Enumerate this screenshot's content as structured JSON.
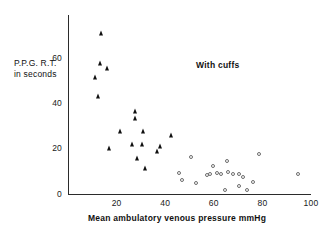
{
  "chart_data": {
    "type": "scatter",
    "title": "",
    "annotation": "With cuffs",
    "xlabel": "Mean  ambulatory  venous  pressure    mmHg",
    "ylabel_line1": "P.P.G.  R.T.",
    "ylabel_line2": "in seconds",
    "xlim": [
      0,
      100
    ],
    "ylim": [
      0,
      77
    ],
    "xticks": [
      20,
      40,
      60,
      80,
      100
    ],
    "yticks": [
      0,
      20,
      40,
      60
    ],
    "xtick_labels": [
      "20",
      "40",
      "60",
      "80",
      "100"
    ],
    "ytick_labels": [
      "0",
      "20",
      "40",
      "60"
    ],
    "grid": false,
    "legend_position": "none",
    "series": [
      {
        "name": "filled-triangle-group",
        "marker": "filled-triangle",
        "color": "#101010",
        "points": [
          {
            "x": 13.6,
            "y": 71.0
          },
          {
            "x": 13.2,
            "y": 57.5
          },
          {
            "x": 11.0,
            "y": 51.5
          },
          {
            "x": 16.0,
            "y": 55.5
          },
          {
            "x": 12.5,
            "y": 43.0
          },
          {
            "x": 17.0,
            "y": 20.0
          },
          {
            "x": 21.5,
            "y": 27.5
          },
          {
            "x": 27.5,
            "y": 36.5
          },
          {
            "x": 27.5,
            "y": 33.5
          },
          {
            "x": 26.5,
            "y": 22.0
          },
          {
            "x": 28.5,
            "y": 15.5
          },
          {
            "x": 30.5,
            "y": 22.0
          },
          {
            "x": 31.0,
            "y": 27.5
          },
          {
            "x": 31.5,
            "y": 11.5
          },
          {
            "x": 36.5,
            "y": 19.0
          },
          {
            "x": 38.0,
            "y": 21.0
          },
          {
            "x": 42.5,
            "y": 26.0
          }
        ]
      },
      {
        "name": "open-circle-group",
        "marker": "open-circle",
        "color": "#6d6d6d",
        "points": [
          {
            "x": 45.5,
            "y": 9.0
          },
          {
            "x": 47.0,
            "y": 6.0
          },
          {
            "x": 50.5,
            "y": 16.0
          },
          {
            "x": 52.5,
            "y": 4.5
          },
          {
            "x": 57.0,
            "y": 8.0
          },
          {
            "x": 58.5,
            "y": 8.5
          },
          {
            "x": 59.5,
            "y": 12.0
          },
          {
            "x": 61.5,
            "y": 9.0
          },
          {
            "x": 63.0,
            "y": 8.5
          },
          {
            "x": 64.5,
            "y": 1.5
          },
          {
            "x": 65.5,
            "y": 14.5
          },
          {
            "x": 66.0,
            "y": 9.5
          },
          {
            "x": 68.0,
            "y": 8.5
          },
          {
            "x": 70.5,
            "y": 8.5
          },
          {
            "x": 70.5,
            "y": 3.5
          },
          {
            "x": 72.0,
            "y": 7.5
          },
          {
            "x": 73.5,
            "y": 1.5
          },
          {
            "x": 76.0,
            "y": 5.0
          },
          {
            "x": 78.5,
            "y": 17.5
          },
          {
            "x": 94.5,
            "y": 8.5
          }
        ]
      }
    ]
  }
}
